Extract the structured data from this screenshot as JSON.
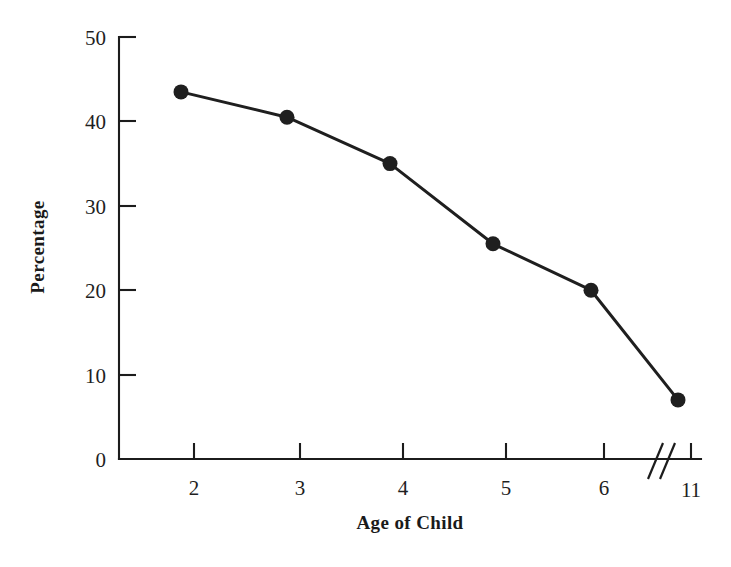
{
  "chart_data": {
    "type": "line",
    "title": "",
    "xlabel": "Age of Child",
    "ylabel": "Percentage",
    "x": [
      2,
      3,
      4,
      5,
      6,
      11
    ],
    "categories": [
      "2",
      "3",
      "4",
      "5",
      "6",
      "11"
    ],
    "values": [
      43.5,
      40.5,
      35,
      25.5,
      20,
      7
    ],
    "series": [
      {
        "name": "Percentage",
        "values": [
          43.5,
          40.5,
          35,
          25.5,
          20,
          7
        ]
      }
    ],
    "xlim": [
      1.5,
      11.5
    ],
    "ylim": [
      0,
      50
    ],
    "x_tick_labels": [
      "2",
      "3",
      "4",
      "5",
      "6",
      "11"
    ],
    "y_tick_labels": [
      "0",
      "10",
      "20",
      "30",
      "40",
      "50"
    ],
    "y_ticks": [
      0,
      10,
      20,
      30,
      40,
      50
    ],
    "grid": false,
    "legend": "none",
    "axis_break": {
      "present": true,
      "between": [
        "6",
        "11"
      ],
      "style": "double-slash"
    },
    "marker": "filled-circle",
    "line_color": "#1f1f1f",
    "marker_color": "#1f1f1f",
    "background_color": "#ffffff"
  },
  "axes": {
    "y_label": "Percentage",
    "x_label": "Age of Child",
    "y_ticks": [
      {
        "label": "50",
        "value": 50
      },
      {
        "label": "40",
        "value": 40
      },
      {
        "label": "30",
        "value": 30
      },
      {
        "label": "20",
        "value": 20
      },
      {
        "label": "10",
        "value": 10
      },
      {
        "label": "0",
        "value": 0
      }
    ],
    "x_ticks": [
      {
        "label": "2",
        "value": 2
      },
      {
        "label": "3",
        "value": 3
      },
      {
        "label": "4",
        "value": 4
      },
      {
        "label": "5",
        "value": 5
      },
      {
        "label": "6",
        "value": 6
      },
      {
        "label": "11",
        "value": 11
      }
    ]
  }
}
